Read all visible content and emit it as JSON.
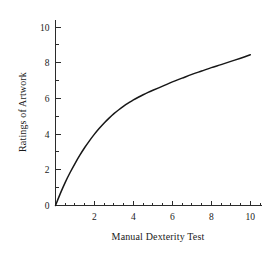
{
  "chart_data": {
    "type": "line",
    "title": "",
    "subtitle": "",
    "xlabel": "Manual Dexterity Test",
    "ylabel": "Ratings of Artwork",
    "xlim": [
      0,
      10.6
    ],
    "ylim": [
      0,
      10.4
    ],
    "grid": false,
    "legend": null,
    "x_ticks_major": [
      2,
      4,
      6,
      8,
      10
    ],
    "x_tick_labels": [
      "2",
      "4",
      "6",
      "8",
      "10"
    ],
    "x_ticks_minor": [
      0.5,
      1,
      1.5,
      2.5,
      3,
      3.5,
      4.5,
      5,
      5.5,
      6.5,
      7,
      7.5,
      8.5,
      9,
      9.5,
      10.5
    ],
    "y_ticks_major": [
      0,
      2,
      4,
      6,
      8,
      10
    ],
    "y_tick_labels": [
      "0",
      "2",
      "4",
      "6",
      "8",
      "10"
    ],
    "y_ticks_minor": [
      1,
      3,
      5,
      7,
      9
    ],
    "series": [
      {
        "name": "ratings-curve",
        "color": "#171717",
        "x": [
          0,
          0.25,
          0.5,
          0.75,
          1,
          1.25,
          1.5,
          1.75,
          2,
          2.25,
          2.5,
          2.75,
          3,
          3.25,
          3.5,
          3.75,
          4,
          4.25,
          4.5,
          4.75,
          5,
          5.5,
          6,
          6.5,
          7,
          7.5,
          8,
          8.5,
          9,
          9.5,
          10
        ],
        "y": [
          0,
          0.68,
          1.3,
          1.85,
          2.35,
          2.82,
          3.25,
          3.64,
          4.0,
          4.33,
          4.63,
          4.9,
          5.15,
          5.37,
          5.57,
          5.75,
          5.92,
          6.07,
          6.21,
          6.34,
          6.46,
          6.69,
          6.93,
          7.14,
          7.35,
          7.54,
          7.73,
          7.9,
          8.08,
          8.26,
          8.45
        ]
      }
    ]
  },
  "axes": {
    "x_title": "Manual Dexterity Test",
    "y_title": "Ratings of Artwork"
  },
  "colors": {
    "background": "#ffffff",
    "curve": "#171717",
    "axis": "#2b2b2b",
    "text": "#1a1a1a"
  }
}
